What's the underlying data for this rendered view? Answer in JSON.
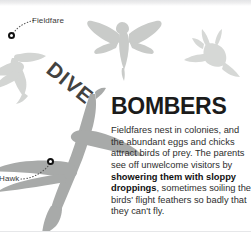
{
  "page": {
    "headline_part1": "DIVE",
    "headline_part2": "BOMBERS"
  },
  "callouts": [
    {
      "id": "fieldfare",
      "label": "Fieldfare",
      "marker": "callout-marker"
    },
    {
      "id": "hawk",
      "label": "Hawk",
      "marker": "callout-marker"
    }
  ],
  "body": {
    "text_1": "Fieldfares nest in colonies, and the abundant eggs and chicks attract birds of prey. The parents see off unwelcome visitors by ",
    "bold_1": "showering them with sloppy droppings",
    "text_2": ", sometimes soiling the birds' flight feathers so badly that they can't fly."
  },
  "illustrations": [
    {
      "name": "hawk-silhouette",
      "subject": "Hawk"
    },
    {
      "name": "fieldfare-silhouette-left",
      "subject": "Fieldfare"
    },
    {
      "name": "fieldfare-silhouette-top",
      "subject": "Fieldfare"
    },
    {
      "name": "fieldfare-silhouette-right",
      "subject": "Fieldfare"
    }
  ],
  "colors": {
    "headline_dive": "#43423f",
    "headline_bombers": "#1b1b1b",
    "body_text": "#2e2e2e",
    "hawk_silhouette": "#a8aaa9",
    "fieldfare_silhouette": "#d3d5d3",
    "marker_stroke": "#111111",
    "page_background": "#ffffff"
  }
}
